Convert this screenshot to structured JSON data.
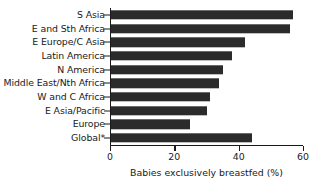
{
  "chart_data": {
    "type": "bar",
    "orientation": "horizontal",
    "title": "",
    "xlabel": "Babies exclusively breastfed (%)",
    "ylabel": "",
    "xlim": [
      0,
      60
    ],
    "xticks": [
      0,
      20,
      40,
      60
    ],
    "grid": false,
    "legend": null,
    "bar_color": "#2b2b2b",
    "axis_color": "#1a1a1a",
    "categories": [
      "S Asia",
      "E and Sth Africa",
      "E Europe/C Asia",
      "Latin America",
      "N America",
      "Middle East/Nth Africa",
      "W and C Africa",
      "E Asia/Pacific",
      "Europe",
      "Global*"
    ],
    "values": [
      57,
      56,
      42,
      38,
      35,
      34,
      31,
      30,
      25,
      44
    ],
    "series": [
      {
        "name": "Babies exclusively breastfed (%)",
        "values": [
          57,
          56,
          42,
          38,
          35,
          34,
          31,
          30,
          25,
          44
        ]
      }
    ]
  }
}
